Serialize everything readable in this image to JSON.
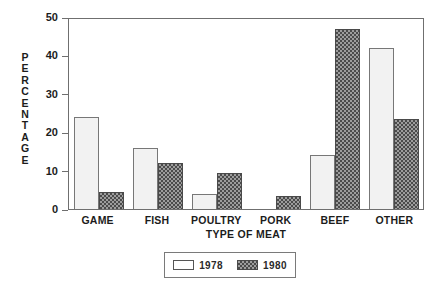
{
  "chart_data": {
    "type": "bar",
    "title": "",
    "xlabel": "TYPE OF MEAT",
    "ylabel": "PERCENTAGE",
    "categories": [
      "GAME",
      "FISH",
      "POULTRY",
      "PORK",
      "BEEF",
      "OTHER"
    ],
    "series": [
      {
        "name": "1978",
        "values": [
          24,
          15.8,
          4,
          0,
          14,
          42
        ]
      },
      {
        "name": "1980",
        "values": [
          4.5,
          12,
          9.5,
          3.5,
          47,
          23.5
        ]
      }
    ],
    "ylim": [
      0,
      50
    ],
    "yticks": [
      0,
      10,
      20,
      30,
      40,
      50
    ],
    "ytick_labels": [
      "0",
      "10",
      "20",
      "30",
      "40",
      "50"
    ],
    "grid": false,
    "legend_position": "bottom-center",
    "colors": {
      "series_1978_fill": "#f2f2f2",
      "series_1978_stroke": "#777777",
      "series_1980_fill": "#4b4b4b",
      "series_1980_stroke": "#4a4a4a",
      "axis": "#6f6f6f",
      "text": "#1c1c1c",
      "background": "#ffffff"
    }
  },
  "axis": {
    "y_title_letters": [
      "P",
      "E",
      "R",
      "C",
      "E",
      "N",
      "T",
      "A",
      "G",
      "E"
    ],
    "x_title": "TYPE OF MEAT"
  },
  "legend": {
    "entries": [
      {
        "label": "1978"
      },
      {
        "label": "1980"
      }
    ]
  }
}
